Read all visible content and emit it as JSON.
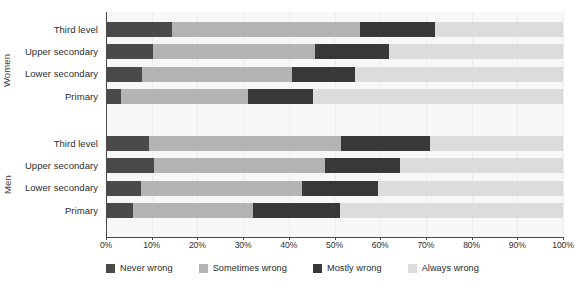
{
  "chart_data": {
    "type": "bar",
    "orientation": "horizontal",
    "stacked": true,
    "normalized_percent": true,
    "title": "",
    "subtitle": "",
    "xlabel": "",
    "ylabel": "",
    "xlim": [
      0,
      100
    ],
    "grid": true,
    "legend_position": "bottom",
    "x_tick_labels": [
      "0%",
      "10%",
      "20%",
      "30%",
      "40%",
      "50%",
      "60%",
      "70%",
      "80%",
      "90%",
      "100%"
    ],
    "x_tick_values": [
      0,
      10,
      20,
      30,
      40,
      50,
      60,
      70,
      80,
      90,
      100
    ],
    "series": [
      {
        "name": "Never wrong",
        "color": "#4a4a4a"
      },
      {
        "name": "Sometimes wrong",
        "color": "#b4b4b4"
      },
      {
        "name": "Mostly wrong",
        "color": "#383838"
      },
      {
        "name": "Always wrong",
        "color": "#dcdcdc"
      }
    ],
    "groups": [
      {
        "name": "Women",
        "categories": [
          "Third level",
          "Upper secondary",
          "Lower secondary",
          "Primary"
        ],
        "rows": [
          {
            "category": "Third level",
            "values": [
              14.4,
              41.2,
              16.3,
              28.1
            ]
          },
          {
            "category": "Upper secondary",
            "values": [
              10.3,
              35.4,
              16.3,
              38.0
            ]
          },
          {
            "category": "Lower secondary",
            "values": [
              7.9,
              32.8,
              13.8,
              45.5
            ]
          },
          {
            "category": "Primary",
            "values": [
              3.3,
              27.8,
              14.2,
              54.7
            ]
          }
        ]
      },
      {
        "name": "Men",
        "categories": [
          "Third level",
          "Upper secondary",
          "Lower secondary",
          "Primary"
        ],
        "rows": [
          {
            "category": "Third level",
            "values": [
              9.4,
              42.0,
              19.5,
              29.1
            ]
          },
          {
            "category": "Upper secondary",
            "values": [
              10.5,
              37.4,
              16.4,
              35.7
            ]
          },
          {
            "category": "Lower secondary",
            "values": [
              7.7,
              35.2,
              16.6,
              40.5
            ]
          },
          {
            "category": "Primary",
            "values": [
              5.9,
              26.3,
              19.0,
              48.8
            ]
          }
        ]
      }
    ]
  },
  "axis": {
    "group_labels": [
      "Women",
      "Men"
    ]
  },
  "legend": {
    "items": [
      {
        "label": "Never wrong",
        "color": "#4a4a4a",
        "swatch_name": "legend-swatch-never-wrong"
      },
      {
        "label": "Sometimes wrong",
        "color": "#b4b4b4",
        "swatch_name": "legend-swatch-sometimes-wrong"
      },
      {
        "label": "Mostly wrong",
        "color": "#383838",
        "swatch_name": "legend-swatch-mostly-wrong"
      },
      {
        "label": "Always wrong",
        "color": "#dcdcdc",
        "swatch_name": "legend-swatch-always-wrong"
      }
    ]
  },
  "colors": {
    "background": "#ffffff",
    "plot_background": "#fafafa",
    "band_alt": "#f7f7f7",
    "axis_line": "#4a4a4a",
    "gridline": "#ececec",
    "text": "#2e2e2e"
  }
}
